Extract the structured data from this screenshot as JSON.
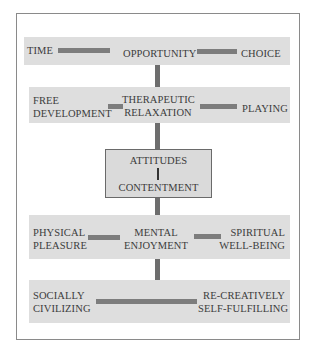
{
  "diagram": {
    "rows": [
      {
        "items": [
          "TIME",
          "OPPORTUNITY",
          "CHOICE"
        ]
      },
      {
        "items": [
          {
            "line1": "FREE",
            "line2": "DEVELOPMENT"
          },
          {
            "line1": "THERAPEUTIC",
            "line2": "RELAXATION"
          },
          {
            "line1": "",
            "line2": "PLAYING"
          }
        ]
      },
      {
        "center_box": {
          "top": "ATTITUDES",
          "bottom": "CONTENTMENT"
        }
      },
      {
        "items": [
          {
            "line1": "PHYSICAL",
            "line2": "PLEASURE"
          },
          {
            "line1": "MENTAL",
            "line2": "ENJOYMENT"
          },
          {
            "line1": "SPIRITUAL",
            "line2": "WELL-BEING"
          }
        ]
      },
      {
        "items": [
          {
            "line1": "SOCIALLY",
            "line2": "CIVILIZING"
          },
          {
            "line1": "RE-CREATIVELY",
            "line2": "SELF-FULFILLING"
          }
        ]
      }
    ],
    "colors": {
      "band": "#dedede",
      "connector": "#7d7d7d",
      "box_fill": "#dadada",
      "frame_border": "#8a8a8a",
      "text": "#3c3c3c"
    }
  }
}
